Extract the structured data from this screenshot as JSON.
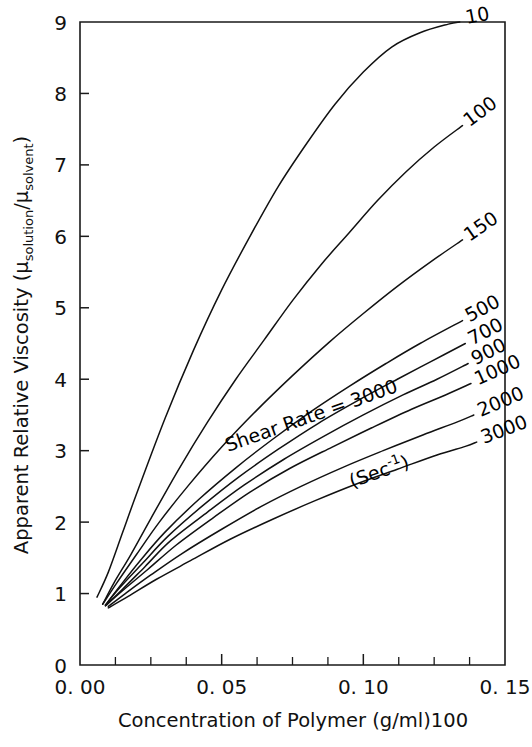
{
  "chart_data": {
    "type": "line",
    "title": "",
    "xlabel": "Concentration of Polymer (g/ml)100",
    "ylabel_text": "Apparent Relative Viscosity (μsolution/μsolvent)",
    "ylabel_parts": {
      "main": "Apparent Relative Viscosity (",
      "mu1": "μ",
      "sub1": "solution",
      "slash": "/",
      "mu2": "μ",
      "sub2": "solvent",
      "close": ")"
    },
    "xlim": [
      0.0,
      0.15
    ],
    "ylim": [
      0,
      9
    ],
    "grid": false,
    "legend": "inline curve labels at right end of each curve",
    "xticks": [
      0.0,
      0.05,
      0.1,
      0.15
    ],
    "xticklabels": [
      "0. 00",
      "0. 05",
      "0. 10",
      "0. 15"
    ],
    "xminorticks": [
      0.0125,
      0.025,
      0.0375,
      0.0625,
      0.075,
      0.0875,
      0.1125,
      0.125,
      0.1375
    ],
    "yticks": [
      0,
      1,
      2,
      3,
      4,
      5,
      6,
      7,
      8,
      9
    ],
    "yticklabels": [
      "0",
      "1",
      "2",
      "3",
      "4",
      "5",
      "6",
      "7",
      "8",
      "9"
    ],
    "annotation": {
      "line1": "Shear Rate = 3000",
      "line2_pre": "(Sec",
      "line2_sup": "-1",
      "line2_post": ")"
    },
    "series": [
      {
        "name": "10",
        "label": "10",
        "shear_rate": 10,
        "points": [
          [
            0.006,
            0.95
          ],
          [
            0.01,
            1.3
          ],
          [
            0.015,
            1.85
          ],
          [
            0.02,
            2.4
          ],
          [
            0.03,
            3.45
          ],
          [
            0.04,
            4.4
          ],
          [
            0.05,
            5.25
          ],
          [
            0.06,
            6.0
          ],
          [
            0.07,
            6.7
          ],
          [
            0.08,
            7.3
          ],
          [
            0.09,
            7.85
          ],
          [
            0.1,
            8.3
          ],
          [
            0.11,
            8.65
          ],
          [
            0.12,
            8.85
          ],
          [
            0.13,
            8.97
          ],
          [
            0.134,
            9.0
          ]
        ]
      },
      {
        "name": "100",
        "label": "100",
        "shear_rate": 100,
        "points": [
          [
            0.008,
            0.85
          ],
          [
            0.012,
            1.15
          ],
          [
            0.018,
            1.55
          ],
          [
            0.025,
            2.05
          ],
          [
            0.035,
            2.75
          ],
          [
            0.045,
            3.4
          ],
          [
            0.055,
            4.0
          ],
          [
            0.065,
            4.55
          ],
          [
            0.075,
            5.1
          ],
          [
            0.085,
            5.6
          ],
          [
            0.095,
            6.05
          ],
          [
            0.105,
            6.5
          ],
          [
            0.115,
            6.9
          ],
          [
            0.125,
            7.25
          ],
          [
            0.135,
            7.55
          ]
        ]
      },
      {
        "name": "150",
        "label": "150",
        "shear_rate": 150,
        "points": [
          [
            0.008,
            0.85
          ],
          [
            0.013,
            1.15
          ],
          [
            0.02,
            1.55
          ],
          [
            0.028,
            2.0
          ],
          [
            0.038,
            2.5
          ],
          [
            0.05,
            3.05
          ],
          [
            0.062,
            3.55
          ],
          [
            0.075,
            4.05
          ],
          [
            0.088,
            4.52
          ],
          [
            0.1,
            4.92
          ],
          [
            0.112,
            5.3
          ],
          [
            0.124,
            5.65
          ],
          [
            0.135,
            5.95
          ]
        ]
      },
      {
        "name": "500",
        "label": "500",
        "shear_rate": 500,
        "points": [
          [
            0.009,
            0.84
          ],
          [
            0.014,
            1.1
          ],
          [
            0.021,
            1.45
          ],
          [
            0.03,
            1.86
          ],
          [
            0.042,
            2.32
          ],
          [
            0.055,
            2.76
          ],
          [
            0.068,
            3.16
          ],
          [
            0.082,
            3.56
          ],
          [
            0.095,
            3.9
          ],
          [
            0.108,
            4.22
          ],
          [
            0.12,
            4.5
          ],
          [
            0.135,
            4.82
          ]
        ]
      },
      {
        "name": "700",
        "label": "700",
        "shear_rate": 700,
        "points": [
          [
            0.009,
            0.84
          ],
          [
            0.014,
            1.08
          ],
          [
            0.022,
            1.42
          ],
          [
            0.031,
            1.8
          ],
          [
            0.043,
            2.22
          ],
          [
            0.056,
            2.63
          ],
          [
            0.07,
            3.02
          ],
          [
            0.084,
            3.38
          ],
          [
            0.098,
            3.7
          ],
          [
            0.112,
            4.0
          ],
          [
            0.124,
            4.25
          ],
          [
            0.136,
            4.5
          ]
        ]
      },
      {
        "name": "900",
        "label": "900",
        "shear_rate": 900,
        "points": [
          [
            0.009,
            0.83
          ],
          [
            0.015,
            1.06
          ],
          [
            0.023,
            1.38
          ],
          [
            0.032,
            1.74
          ],
          [
            0.045,
            2.14
          ],
          [
            0.058,
            2.52
          ],
          [
            0.072,
            2.88
          ],
          [
            0.086,
            3.2
          ],
          [
            0.1,
            3.5
          ],
          [
            0.114,
            3.78
          ],
          [
            0.126,
            4.0
          ],
          [
            0.137,
            4.22
          ]
        ]
      },
      {
        "name": "1000",
        "label": "1000",
        "shear_rate": 1000,
        "points": [
          [
            0.009,
            0.83
          ],
          [
            0.015,
            1.04
          ],
          [
            0.024,
            1.34
          ],
          [
            0.034,
            1.68
          ],
          [
            0.047,
            2.06
          ],
          [
            0.06,
            2.42
          ],
          [
            0.074,
            2.75
          ],
          [
            0.089,
            3.05
          ],
          [
            0.103,
            3.32
          ],
          [
            0.117,
            3.58
          ],
          [
            0.129,
            3.78
          ],
          [
            0.138,
            3.94
          ]
        ]
      },
      {
        "name": "2000",
        "label": "2000",
        "shear_rate": 2000,
        "points": [
          [
            0.01,
            0.82
          ],
          [
            0.016,
            1.0
          ],
          [
            0.025,
            1.26
          ],
          [
            0.036,
            1.56
          ],
          [
            0.05,
            1.9
          ],
          [
            0.064,
            2.22
          ],
          [
            0.078,
            2.5
          ],
          [
            0.093,
            2.77
          ],
          [
            0.107,
            3.0
          ],
          [
            0.121,
            3.22
          ],
          [
            0.133,
            3.4
          ],
          [
            0.139,
            3.5
          ]
        ]
      },
      {
        "name": "3000",
        "label": "3000",
        "shear_rate": 3000,
        "points": [
          [
            0.01,
            0.8
          ],
          [
            0.017,
            0.96
          ],
          [
            0.027,
            1.2
          ],
          [
            0.039,
            1.46
          ],
          [
            0.053,
            1.76
          ],
          [
            0.068,
            2.04
          ],
          [
            0.083,
            2.3
          ],
          [
            0.098,
            2.54
          ],
          [
            0.112,
            2.74
          ],
          [
            0.126,
            2.94
          ],
          [
            0.136,
            3.06
          ],
          [
            0.14,
            3.12
          ]
        ]
      }
    ]
  },
  "figure": {
    "background_color": "#ffffff",
    "line_color": "#111111",
    "axis_color": "#1a1a1a"
  }
}
